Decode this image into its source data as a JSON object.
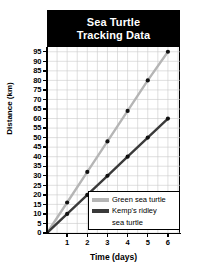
{
  "chart_data": {
    "type": "line",
    "title": "Sea Turtle Tracking Data",
    "title_line1": "Sea Turtle",
    "title_line2": "Tracking Data",
    "xlabel": "Time (days)",
    "ylabel": "Distance (km)",
    "xlim": [
      0,
      6.6
    ],
    "ylim": [
      0,
      97.5
    ],
    "grid": true,
    "legend_position": "bottom-right",
    "x": [
      0,
      1,
      2,
      3,
      4,
      5,
      6
    ],
    "xticks": [
      1,
      2,
      3,
      4,
      5,
      6
    ],
    "yticks": [
      0,
      5,
      10,
      15,
      20,
      25,
      30,
      35,
      40,
      45,
      50,
      55,
      60,
      65,
      70,
      75,
      80,
      85,
      90,
      95
    ],
    "series": [
      {
        "name": "Green sea turtle",
        "color": "#b5b5b5",
        "marker_color": "#111111",
        "values": [
          0,
          16,
          32,
          48,
          64,
          80,
          95
        ]
      },
      {
        "name": "Kemp's ridley sea turtle",
        "label_line1": "Kemp's ridley",
        "label_line2": "sea turtle",
        "color": "#3a3a3a",
        "marker_color": "#111111",
        "values": [
          0,
          10,
          20,
          30,
          40,
          50,
          60
        ]
      }
    ]
  },
  "legend": {
    "entries": [
      {
        "label": "Green sea turtle",
        "color": "#b5b5b5"
      },
      {
        "label": "Kemp's ridley",
        "label_cont": "sea turtle",
        "color": "#3a3a3a"
      }
    ]
  },
  "colors": {
    "banner_bg": "#000000",
    "banner_text": "#ffffff",
    "grid": "#c9c9c9",
    "axis": "#000000",
    "plot_bg": "#ffffff"
  }
}
